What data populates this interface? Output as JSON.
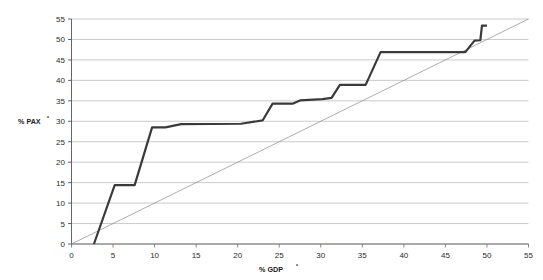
{
  "chart_data": {
    "type": "line",
    "title": "",
    "subtitle": "",
    "xlabel": "% GDP",
    "xlabel_sup": "*",
    "ylabel": "% PAX",
    "ylabel_sup": "*",
    "xlim": [
      0,
      55
    ],
    "ylim": [
      0,
      55
    ],
    "xticks": [
      0,
      5,
      10,
      15,
      20,
      25,
      30,
      35,
      40,
      45,
      50,
      55
    ],
    "yticks": [
      0,
      5,
      10,
      15,
      20,
      25,
      30,
      35,
      40,
      45,
      50,
      55
    ],
    "xtick_labels": [
      "0",
      "5",
      "10",
      "15",
      "20",
      "25",
      "30",
      "35",
      "40",
      "45",
      "50",
      "55"
    ],
    "ytick_labels": [
      "0",
      "5",
      "10",
      "15",
      "20",
      "25",
      "30",
      "35",
      "40",
      "45",
      "50",
      "55"
    ],
    "grid": "horizontal",
    "legend": "none",
    "series": [
      {
        "name": "concentration-curve",
        "style": "thick-step-line",
        "color": "#3a3a3a",
        "width": 2.2,
        "points": [
          [
            2.7,
            0.0
          ],
          [
            5.2,
            14.4
          ],
          [
            7.6,
            14.4
          ],
          [
            9.7,
            28.5
          ],
          [
            11.3,
            28.5
          ],
          [
            13.2,
            29.3
          ],
          [
            20.4,
            29.4
          ],
          [
            23.0,
            30.2
          ],
          [
            24.2,
            34.3
          ],
          [
            26.6,
            34.3
          ],
          [
            27.5,
            35.1
          ],
          [
            30.2,
            35.4
          ],
          [
            31.3,
            35.7
          ],
          [
            32.3,
            38.9
          ],
          [
            35.4,
            38.9
          ],
          [
            37.2,
            46.9
          ],
          [
            47.4,
            46.9
          ],
          [
            48.5,
            49.7
          ],
          [
            49.2,
            49.8
          ],
          [
            49.4,
            53.4
          ],
          [
            50.0,
            53.4
          ]
        ]
      },
      {
        "name": "equality-reference-line",
        "style": "thin-diagonal",
        "color": "#8a8a8a",
        "width": 0.7,
        "points": [
          [
            0,
            0
          ],
          [
            55,
            55
          ]
        ]
      }
    ]
  }
}
